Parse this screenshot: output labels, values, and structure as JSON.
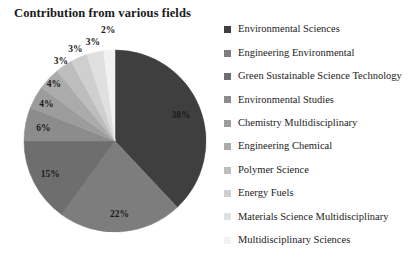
{
  "chart_data": {
    "type": "pie",
    "title": "Contribution from various fields",
    "xlabel": "",
    "ylabel": "",
    "legend_position": "right",
    "grid": false,
    "value_suffix": "%",
    "start_angle_deg": 0,
    "direction": "clockwise",
    "categories": [
      "Environmental Sciences",
      "Engineering Environmental",
      "Green Sustainable Science Technology",
      "Environmental Studies",
      "Chemistry Multidisciplinary",
      "Engineering Chemical",
      "Polymer Science",
      "Energy Fuels",
      "Materials Science Multidisciplinary",
      "Multidisciplinary Sciences"
    ],
    "values": [
      38,
      22,
      15,
      6,
      4,
      4,
      3,
      3,
      3,
      2
    ],
    "labels": [
      "38%",
      "22%",
      "15%",
      "6%",
      "4%",
      "4%",
      "3%",
      "3%",
      "3%",
      "2%"
    ],
    "colors": [
      "#3f3f3f",
      "#7d7d7d",
      "#6e6e6e",
      "#8c8c8c",
      "#9c9c9c",
      "#ababab",
      "#bdbdbd",
      "#cfcfcf",
      "#e0e0e0",
      "#f2f2f2"
    ],
    "label_colors": [
      "#1a1a1a",
      "#1a1a1a",
      "#1a1a1a",
      "#1a1a1a",
      "#1a1a1a",
      "#1a1a1a",
      "#1a1a1a",
      "#1a1a1a",
      "#1a1a1a",
      "#1a1a1a"
    ]
  },
  "legend": {
    "items": [
      {
        "label": "Environmental Sciences",
        "color": "#3f3f3f"
      },
      {
        "label": "Engineering Environmental",
        "color": "#7d7d7d"
      },
      {
        "label": "Green Sustainable Science Technology",
        "color": "#6e6e6e"
      },
      {
        "label": "Environmental Studies",
        "color": "#8c8c8c"
      },
      {
        "label": "Chemistry Multidisciplinary",
        "color": "#9c9c9c"
      },
      {
        "label": "Engineering Chemical",
        "color": "#ababab"
      },
      {
        "label": "Polymer Science",
        "color": "#bdbdbd"
      },
      {
        "label": "Energy Fuels",
        "color": "#cfcfcf"
      },
      {
        "label": "Materials Science Multidisciplinary",
        "color": "#e0e0e0"
      },
      {
        "label": "Multidisciplinary Sciences",
        "color": "#f2f2f2"
      }
    ]
  },
  "geometry": {
    "center_x": 115,
    "center_y": 141,
    "radius": 91
  }
}
